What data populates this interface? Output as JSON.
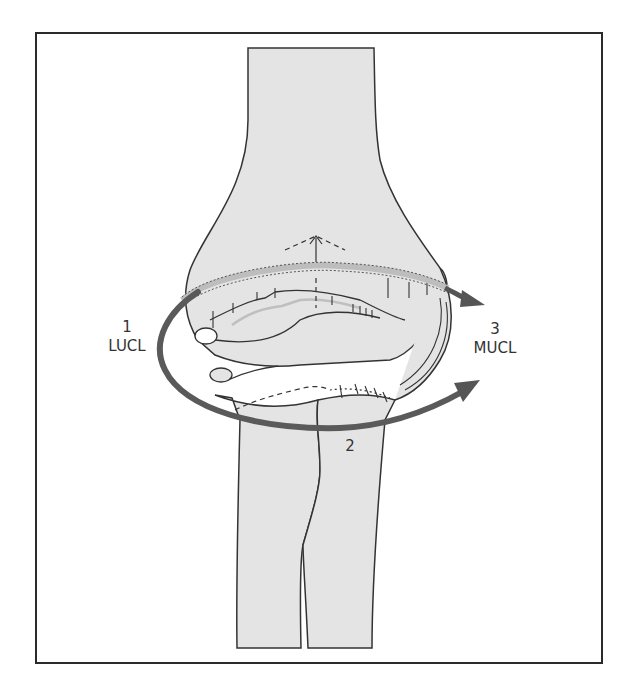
{
  "figure": {
    "colors": {
      "bone_fill": "#e4e4e4",
      "outline": "#333333",
      "arrow": "#555555",
      "band_fill": "#c8c8c8",
      "frame": "#2a2a2a"
    }
  },
  "labels": {
    "stage1": {
      "number": "1",
      "name": "LUCL"
    },
    "stage2": {
      "number": "2"
    },
    "stage3": {
      "number": "3",
      "name": "MUCL"
    }
  }
}
